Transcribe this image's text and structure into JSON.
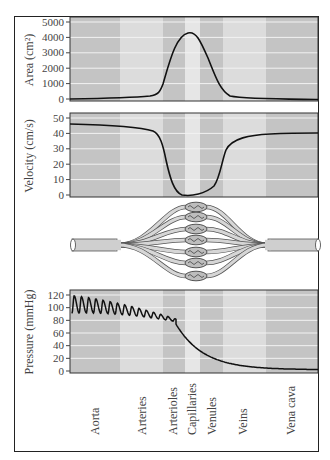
{
  "figure": {
    "segments": [
      "Aorta",
      "Arteries",
      "Arterioles",
      "Capillaries",
      "Venules",
      "Veins",
      "Vena cava"
    ],
    "band_edges_px": [
      70,
      120,
      163,
      185,
      200,
      223,
      266,
      318
    ],
    "band_colors": [
      "#c4c4c4",
      "#dcdcdc",
      "#c4c4c4",
      "#e6e6e6",
      "#c4c4c4",
      "#dcdcdc",
      "#c4c4c4"
    ]
  },
  "panels": {
    "area": {
      "ylabel": "Area (cm²)",
      "ticks": [
        "0",
        "1000",
        "2000",
        "3000",
        "4000",
        "5000"
      ]
    },
    "velocity": {
      "ylabel": "Velocity (cm/s)",
      "ticks": [
        "0",
        "10",
        "20",
        "30",
        "40",
        "50"
      ]
    },
    "pressure": {
      "ylabel": "Pressure (mmHg)",
      "ticks": [
        "0",
        "20",
        "40",
        "60",
        "80",
        "100",
        "120"
      ]
    }
  },
  "x_labels": {
    "aorta": "Aorta",
    "arteries": "Arteries",
    "arterioles": "Arterioles",
    "capillaries": "Capillaries",
    "venules": "Venules",
    "veins": "Veins",
    "vena_cava": "Vena cava"
  },
  "chart_data": [
    {
      "type": "line",
      "title": "",
      "xlabel": "",
      "ylabel": "Area (cm²)",
      "ylim": [
        0,
        5500
      ],
      "categories": [
        "Aorta",
        "Arteries",
        "Arterioles",
        "Capillaries",
        "Venules",
        "Veins",
        "Vena cava"
      ],
      "values": [
        100,
        200,
        1800,
        4500,
        1800,
        200,
        100
      ]
    },
    {
      "type": "line",
      "title": "",
      "xlabel": "",
      "ylabel": "Velocity (cm/s)",
      "ylim": [
        0,
        55
      ],
      "categories": [
        "Aorta",
        "Arteries",
        "Arterioles",
        "Capillaries",
        "Venules",
        "Veins",
        "Vena cava"
      ],
      "values": [
        49,
        46,
        20,
        1,
        5,
        40,
        43
      ]
    },
    {
      "type": "line",
      "title": "",
      "xlabel": "",
      "ylabel": "Pressure (mmHg)",
      "ylim": [
        0,
        130
      ],
      "categories": [
        "Aorta",
        "Arteries",
        "Arterioles",
        "Capillaries",
        "Venules",
        "Veins",
        "Vena cava"
      ],
      "values": [
        105,
        95,
        60,
        25,
        15,
        8,
        3
      ],
      "annotations": [
        "Pulsatile oscillation 90-120 mmHg in aorta, damping through arteries/arterioles"
      ]
    }
  ]
}
